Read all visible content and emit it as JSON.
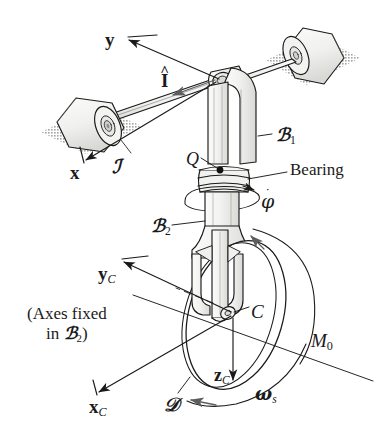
{
  "figure": {
    "background_color": "#ffffff",
    "ink_color": "#1a1a1a",
    "shadow_color": "#b4b4b4",
    "metal_fill": "#f4f4f2",
    "metal_shade": "#dcdcda"
  },
  "labels": {
    "axis_y": "y",
    "unit_vector_i": "I",
    "unit_vector_i_accent": "^",
    "axis_x": "x",
    "frame_J": "ℐ",
    "body_B1_letter": "ℬ",
    "body_B1_sub": "1",
    "point_Q": "Q",
    "bearing": "Bearing",
    "phi_letter": "φ",
    "phi_accent": "˙",
    "body_B2_letter": "ℬ",
    "body_B2_sub": "2",
    "axis_yC_letter": "y",
    "axis_yC_sub": "C",
    "axes_fixed_line1": "(Axes fixed",
    "axes_fixed_line2_pre": "in ",
    "axes_fixed_line2_body": "ℬ",
    "axes_fixed_line2_sub": "2",
    "axes_fixed_line2_post": ")",
    "point_C": "C",
    "moment_letter": "M",
    "moment_sub": "0",
    "axis_zC_letter": "z",
    "axis_zC_sub": "C",
    "axis_xC_letter": "x",
    "axis_xC_sub": "C",
    "disk_D": "ℐ",
    "disk_D_glyph": "𝒟",
    "omega_letter": "ω",
    "omega_sub": "s"
  },
  "geometry": {
    "rod_left_roller_center": [
      95,
      120
    ],
    "rod_right_roller_center": [
      300,
      50
    ],
    "elbow": [
      223,
      76
    ],
    "bearing_point_Q": [
      218,
      168
    ],
    "wheel_center_C": [
      236,
      315
    ],
    "wheel_radius_major": 78,
    "wheel_radius_minor": 48,
    "post_axis_x": 222
  }
}
